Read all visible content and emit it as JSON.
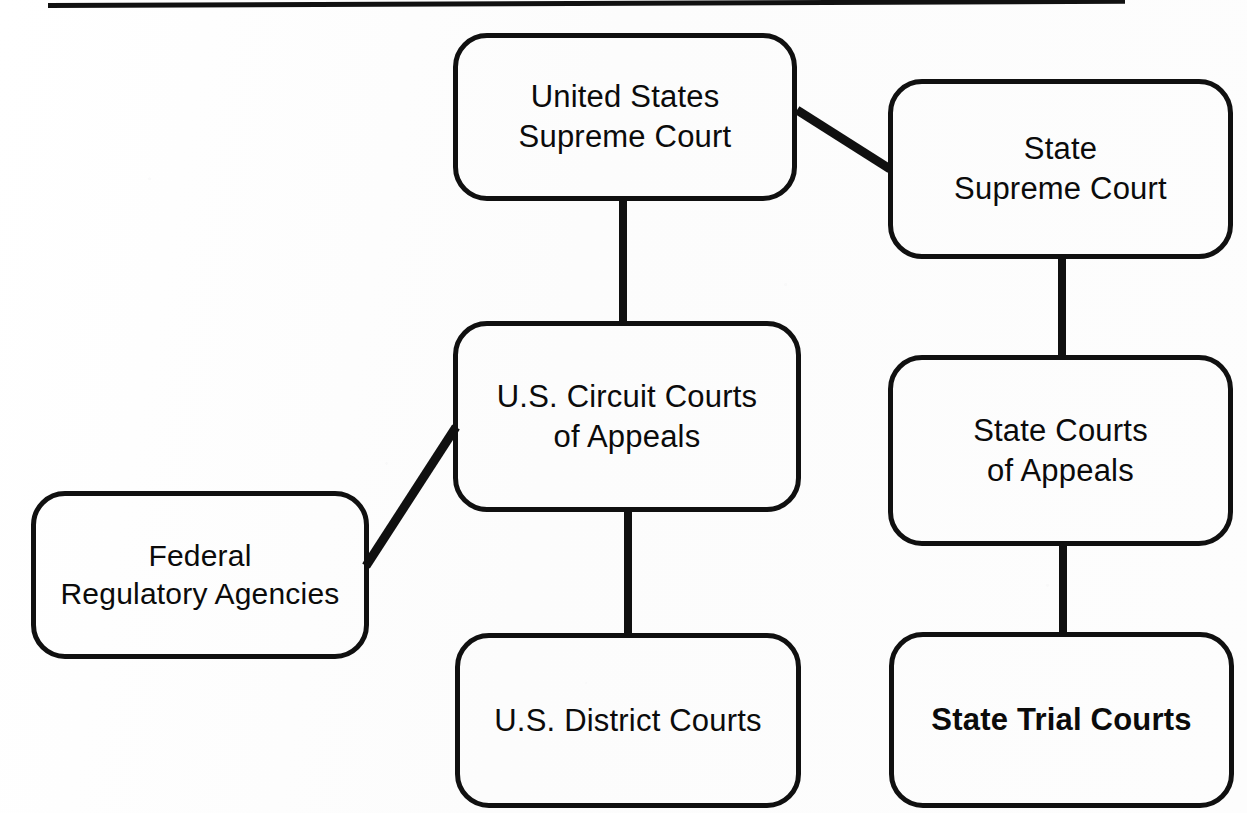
{
  "diagram": {
    "divider": {
      "name": "top-horizontal-rule",
      "color": "#111111"
    },
    "ink_color": "#101010",
    "page_color": "#fdfdfd",
    "nodes": [
      {
        "id": "us-supreme",
        "label": "United States\nSupreme Court"
      },
      {
        "id": "state-supreme",
        "label": "State\nSupreme Court"
      },
      {
        "id": "us-circuit",
        "label": "U.S. Circuit Courts\nof Appeals"
      },
      {
        "id": "state-appeals",
        "label": "State Courts\nof Appeals"
      },
      {
        "id": "federal-agency",
        "label": "Federal\nRegulatory Agencies"
      },
      {
        "id": "us-district",
        "label": "U.S. District Courts"
      },
      {
        "id": "state-trial",
        "label": "State Trial Courts"
      }
    ],
    "edges": [
      {
        "id": "edge-us-supreme-to-state-supreme",
        "from": "us-supreme",
        "to": "state-supreme",
        "kind": "diagonal",
        "x1": 797,
        "y1": 110,
        "x2": 890,
        "y2": 169
      },
      {
        "id": "edge-us-supreme-to-us-circuit",
        "from": "us-supreme",
        "to": "us-circuit",
        "kind": "vertical",
        "x1": 623,
        "y1": 198,
        "x2": 623,
        "y2": 324
      },
      {
        "id": "edge-state-supreme-to-state-appeals",
        "from": "state-supreme",
        "to": "state-appeals",
        "kind": "vertical",
        "x1": 1062,
        "y1": 256,
        "x2": 1062,
        "y2": 358
      },
      {
        "id": "edge-federal-agency-to-us-circuit",
        "from": "federal-agency",
        "to": "us-circuit",
        "kind": "diagonal",
        "x1": 366,
        "y1": 565,
        "x2": 455,
        "y2": 428
      },
      {
        "id": "edge-us-circuit-to-us-district",
        "from": "us-circuit",
        "to": "us-district",
        "kind": "vertical",
        "x1": 628,
        "y1": 509,
        "x2": 628,
        "y2": 636
      },
      {
        "id": "edge-state-appeals-to-state-trial",
        "from": "state-appeals",
        "to": "state-trial",
        "kind": "vertical",
        "x1": 1063,
        "y1": 543,
        "x2": 1063,
        "y2": 635
      }
    ]
  }
}
